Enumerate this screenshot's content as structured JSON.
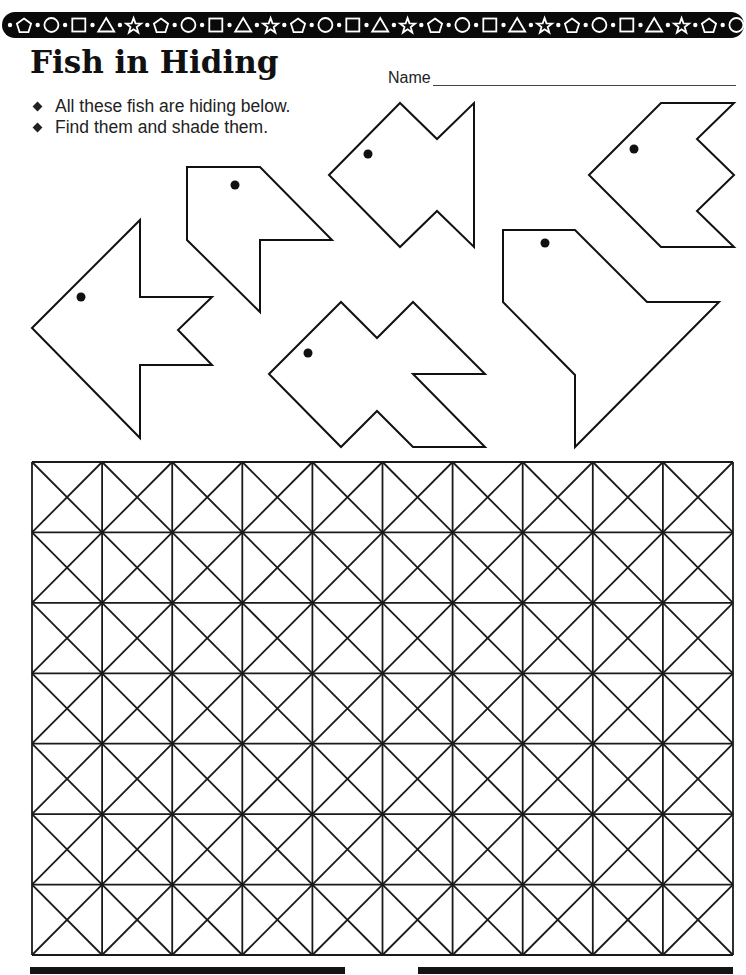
{
  "banner": {
    "pattern": [
      "pentagon",
      "circle",
      "square",
      "triangle",
      "star"
    ],
    "separator": "dot",
    "background": "#0a0a0a",
    "shape_color": "#ffffff"
  },
  "header": {
    "title": "Fish in Hiding",
    "name_label": "Name",
    "name_value": ""
  },
  "instructions": [
    "All these fish are hiding below.",
    "Find them and shade them."
  ],
  "fish": [
    {
      "id": "fish-1",
      "points": "32,328 140,220 140,297 212,297 178,330 212,365 140,365 140,438",
      "eye": [
        81,
        297
      ]
    },
    {
      "id": "fish-2",
      "points": "187,167 260,167 332,240 260,240 260,312 187,240",
      "eye": [
        235,
        185
      ]
    },
    {
      "id": "fish-3",
      "points": "329,175 400,103 437,139 474,103 474,247 437,211 400,247",
      "eye": [
        368,
        154
      ]
    },
    {
      "id": "fish-4",
      "points": "589,175 661,103 734,103 697,139 734,175 697,211 734,247 661,247",
      "eye": [
        634,
        149
      ]
    },
    {
      "id": "fish-5",
      "points": "269,374 341,302 377,338 413,302 485,374 413,374 485,447 413,447 377,411 341,447",
      "eye": [
        308,
        353
      ]
    },
    {
      "id": "fish-6",
      "points": "503,230 575,230 647,302 719,302 575,447 575,375 503,302",
      "eye": [
        545,
        243
      ]
    }
  ],
  "grid": {
    "columns": 10,
    "rows": 7,
    "left": 32,
    "top": 462,
    "width": 701,
    "height": 493,
    "line_color": "#1a1a1a"
  },
  "footer_rules": [
    {
      "left": 30,
      "width": 315
    },
    {
      "left": 418,
      "width": 315
    }
  ]
}
